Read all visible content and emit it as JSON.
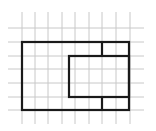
{
  "diagram": {
    "type": "grid-figure",
    "colors": {
      "background": "#ffffff",
      "grid": "#c8c8c8",
      "outline": "#1a1a1a"
    },
    "grid": {
      "vertical_x": [
        22,
        35,
        48,
        62,
        75,
        89,
        102,
        116,
        130
      ],
      "vertical_y_range": [
        12,
        124
      ],
      "horizontal_y": [
        28,
        42,
        56,
        69,
        83,
        97,
        110
      ],
      "horizontal_x_range": [
        8,
        144
      ]
    },
    "shapes": [
      {
        "name": "outer-rectangle",
        "x": 22,
        "y": 42,
        "w": 107,
        "h": 68
      },
      {
        "name": "inner-rectangle",
        "x": 69,
        "y": 56,
        "w": 60,
        "h": 41
      }
    ],
    "segments": [
      {
        "name": "top-divider",
        "x1": 102,
        "y1": 42,
        "x2": 102,
        "y2": 56
      },
      {
        "name": "bottom-divider",
        "x1": 102,
        "y1": 97,
        "x2": 102,
        "y2": 110
      }
    ]
  }
}
